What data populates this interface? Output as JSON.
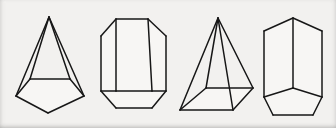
{
  "panel": {
    "title": "Polyhedra line drawings",
    "width": 336,
    "height": 128,
    "background_color": "#f2f1ef",
    "face_fill_color": "#f7f6f4",
    "line_color": "#171717",
    "line_width": 1.5,
    "figure_count": 4
  },
  "figures": [
    {
      "id": "figure-1",
      "name": "pentagonal-pyramid",
      "label": "Pentagonal pyramid",
      "apex": [
        49,
        17
      ],
      "base_outline": "16,96 30,79 70,79 84,96 48,113",
      "edges": [
        "M49,17 L16,96",
        "M49,17 L30,79",
        "M49,17 L70,79",
        "M49,17 L84,96",
        "M30,79 L70,79",
        "M16,96 L30,79",
        "M70,79 L84,96",
        "M16,96 L48,113",
        "M48,113 L84,96"
      ]
    },
    {
      "id": "figure-2",
      "name": "octagonal-prism",
      "label": "Octagonal prism",
      "outer_outline": "116,19 148,19 166,36 166,91 152,108 116,108 101,91 101,36",
      "edges": [
        "M116,19 L148,19",
        "M148,19 L166,36",
        "M166,36 L166,91",
        "M166,91 L152,108",
        "M152,108 L116,108",
        "M116,108 L101,91",
        "M101,91 L101,36",
        "M101,36 L116,19",
        "M116,19 L116,91",
        "M148,19 L152,91",
        "M101,91 L116,91",
        "M116,91 L152,91",
        "M152,91 L166,91"
      ]
    },
    {
      "id": "figure-3",
      "name": "oblique-pyramid",
      "label": "Oblique pyramid",
      "apex": [
        218,
        18
      ],
      "base_outline": "180,110 233,110 253,88 206,88",
      "edges": [
        "M218,18 L180,110",
        "M218,18 L206,88",
        "M218,18 L253,88",
        "M218,18 L233,110",
        "M206,88 L253,88",
        "M180,110 L206,88",
        "M180,110 L233,110",
        "M233,110 L253,88"
      ]
    },
    {
      "id": "figure-4",
      "name": "pentagonal-prism",
      "label": "Pentagonal prism",
      "outer_outline": "293,18 322,31 322,97 313,115 273,115 264,97 264,31",
      "edges": [
        "M293,18 L322,31",
        "M322,31 L322,97",
        "M322,97 L313,115",
        "M313,115 L273,115",
        "M273,115 L264,97",
        "M264,97 L264,31",
        "M264,31 L293,18",
        "M293,18 L293,88",
        "M264,97 L293,88",
        "M293,88 L322,97"
      ]
    }
  ]
}
